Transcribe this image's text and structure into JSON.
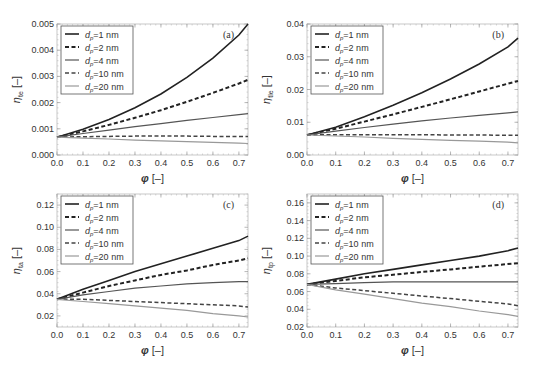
{
  "figure": {
    "x_label": "φ [–]",
    "legend": [
      {
        "label": "d",
        "sub": "p",
        "suffix": "=1 nm",
        "color": "#222222",
        "width": 1.6,
        "dash": ""
      },
      {
        "label": "d",
        "sub": "p",
        "suffix": "=2 nm",
        "color": "#222222",
        "width": 2.0,
        "dash": "4,2.5"
      },
      {
        "label": "d",
        "sub": "p",
        "suffix": "=4 nm",
        "color": "#555555",
        "width": 1.2,
        "dash": ""
      },
      {
        "label": "d",
        "sub": "p",
        "suffix": "=10 nm",
        "color": "#444444",
        "width": 1.5,
        "dash": "4,2.5"
      },
      {
        "label": "d",
        "sub": "p",
        "suffix": "=20 nm",
        "color": "#999999",
        "width": 1.2,
        "dash": ""
      }
    ]
  },
  "chart_data": [
    {
      "type": "line",
      "panel": "(a)",
      "ylabel": "η_te [–]",
      "ylabel_main": "η",
      "ylabel_sub": "te",
      "xlabel": "φ [–]",
      "xlim": [
        0,
        0.735
      ],
      "ylim": [
        0,
        0.005
      ],
      "xticks": [
        0.0,
        0.1,
        0.2,
        0.3,
        0.4,
        0.5,
        0.6,
        0.7
      ],
      "yticks": [
        0.0,
        0.001,
        0.002,
        0.003,
        0.004,
        0.005
      ],
      "ytick_labels": [
        "0.000",
        "0.001",
        "0.002",
        "0.003",
        "0.004",
        "0.005"
      ],
      "x": [
        0.0,
        0.1,
        0.2,
        0.3,
        0.4,
        0.5,
        0.6,
        0.7,
        0.735
      ],
      "series": [
        {
          "name": "dp=1 nm",
          "values": [
            0.00068,
            0.00098,
            0.00135,
            0.0018,
            0.00233,
            0.00296,
            0.0037,
            0.00458,
            0.005
          ]
        },
        {
          "name": "dp=2 nm",
          "values": [
            0.00068,
            0.0009,
            0.00115,
            0.00142,
            0.00171,
            0.00203,
            0.00237,
            0.00273,
            0.00287
          ]
        },
        {
          "name": "dp=4 nm",
          "values": [
            0.00068,
            0.00082,
            0.00095,
            0.00108,
            0.0012,
            0.00132,
            0.00143,
            0.00154,
            0.00158
          ]
        },
        {
          "name": "dp=10 nm",
          "values": [
            0.00068,
            0.0007,
            0.00071,
            0.00072,
            0.00072,
            0.00072,
            0.00071,
            0.00071,
            0.00071
          ]
        },
        {
          "name": "dp=20 nm",
          "values": [
            0.00068,
            0.00064,
            0.00061,
            0.00057,
            0.00054,
            0.00051,
            0.00048,
            0.00045,
            0.00044
          ]
        }
      ]
    },
    {
      "type": "line",
      "panel": "(b)",
      "ylabel": "η_tle [–]",
      "ylabel_main": "η",
      "ylabel_sub": "tle",
      "xlabel": "φ [–]",
      "xlim": [
        0,
        0.735
      ],
      "ylim": [
        0,
        0.04
      ],
      "xticks": [
        0.0,
        0.1,
        0.2,
        0.3,
        0.4,
        0.5,
        0.6,
        0.7
      ],
      "yticks": [
        0.0,
        0.01,
        0.02,
        0.03,
        0.04
      ],
      "ytick_labels": [
        "0.00",
        "0.01",
        "0.02",
        "0.03",
        "0.04"
      ],
      "x": [
        0.0,
        0.1,
        0.2,
        0.3,
        0.4,
        0.5,
        0.6,
        0.7,
        0.735
      ],
      "series": [
        {
          "name": "dp=1 nm",
          "values": [
            0.0061,
            0.0085,
            0.0117,
            0.0152,
            0.019,
            0.0232,
            0.0278,
            0.033,
            0.0357
          ]
        },
        {
          "name": "dp=2 nm",
          "values": [
            0.0061,
            0.008,
            0.0102,
            0.0124,
            0.0147,
            0.017,
            0.0194,
            0.0218,
            0.0226
          ]
        },
        {
          "name": "dp=4 nm",
          "values": [
            0.0061,
            0.0073,
            0.0084,
            0.0094,
            0.0104,
            0.0113,
            0.0121,
            0.0129,
            0.0132
          ]
        },
        {
          "name": "dp=10 nm",
          "values": [
            0.0061,
            0.0062,
            0.0062,
            0.0062,
            0.0062,
            0.0061,
            0.0061,
            0.006,
            0.006
          ]
        },
        {
          "name": "dp=20 nm",
          "values": [
            0.0061,
            0.0058,
            0.0055,
            0.0051,
            0.0048,
            0.0045,
            0.0042,
            0.0039,
            0.0037
          ]
        }
      ]
    },
    {
      "type": "line",
      "panel": "(c)",
      "ylabel": "η_ta [–]",
      "ylabel_main": "η",
      "ylabel_sub": "ta",
      "xlabel": "φ [–]",
      "xlim": [
        0,
        0.735
      ],
      "ylim": [
        0.01,
        0.13
      ],
      "xticks": [
        0.0,
        0.1,
        0.2,
        0.3,
        0.4,
        0.5,
        0.6,
        0.7
      ],
      "yticks": [
        0.02,
        0.04,
        0.06,
        0.08,
        0.1,
        0.12
      ],
      "ytick_labels": [
        "0.02",
        "0.04",
        "0.06",
        "0.08",
        "0.10",
        "0.12"
      ],
      "x": [
        0.0,
        0.1,
        0.2,
        0.3,
        0.4,
        0.5,
        0.6,
        0.7,
        0.735
      ],
      "series": [
        {
          "name": "dp=1 nm",
          "values": [
            0.035,
            0.044,
            0.052,
            0.06,
            0.067,
            0.074,
            0.081,
            0.088,
            0.092
          ]
        },
        {
          "name": "dp=2 nm",
          "values": [
            0.035,
            0.041,
            0.047,
            0.052,
            0.057,
            0.061,
            0.066,
            0.07,
            0.072
          ]
        },
        {
          "name": "dp=4 nm",
          "values": [
            0.035,
            0.039,
            0.042,
            0.045,
            0.047,
            0.049,
            0.05,
            0.051,
            0.051
          ]
        },
        {
          "name": "dp=10 nm",
          "values": [
            0.035,
            0.035,
            0.034,
            0.033,
            0.032,
            0.031,
            0.03,
            0.029,
            0.028
          ]
        },
        {
          "name": "dp=20 nm",
          "values": [
            0.035,
            0.033,
            0.031,
            0.029,
            0.027,
            0.025,
            0.022,
            0.02,
            0.019
          ]
        }
      ]
    },
    {
      "type": "line",
      "panel": "(d)",
      "ylabel": "η_tp [–]",
      "ylabel_main": "η",
      "ylabel_sub": "tp",
      "xlabel": "φ [–]",
      "xlim": [
        0,
        0.735
      ],
      "ylim": [
        0.02,
        0.17
      ],
      "xticks": [
        0.0,
        0.1,
        0.2,
        0.3,
        0.4,
        0.5,
        0.6,
        0.7
      ],
      "yticks": [
        0.02,
        0.04,
        0.06,
        0.08,
        0.1,
        0.12,
        0.14,
        0.16
      ],
      "ytick_labels": [
        "0.02",
        "0.04",
        "0.06",
        "0.08",
        "0.10",
        "0.12",
        "0.14",
        "0.16"
      ],
      "x": [
        0.0,
        0.1,
        0.2,
        0.3,
        0.4,
        0.5,
        0.6,
        0.7,
        0.735
      ],
      "series": [
        {
          "name": "dp=1 nm",
          "values": [
            0.068,
            0.074,
            0.08,
            0.085,
            0.09,
            0.095,
            0.1,
            0.106,
            0.109
          ]
        },
        {
          "name": "dp=2 nm",
          "values": [
            0.068,
            0.072,
            0.076,
            0.079,
            0.082,
            0.085,
            0.088,
            0.091,
            0.092
          ]
        },
        {
          "name": "dp=4 nm",
          "values": [
            0.068,
            0.069,
            0.07,
            0.071,
            0.071,
            0.071,
            0.071,
            0.071,
            0.071
          ]
        },
        {
          "name": "dp=10 nm",
          "values": [
            0.068,
            0.064,
            0.061,
            0.058,
            0.055,
            0.052,
            0.049,
            0.046,
            0.044
          ]
        },
        {
          "name": "dp=20 nm",
          "values": [
            0.068,
            0.062,
            0.057,
            0.052,
            0.047,
            0.043,
            0.038,
            0.034,
            0.032
          ]
        }
      ]
    }
  ]
}
